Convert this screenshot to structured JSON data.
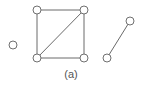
{
  "diagram": {
    "caption": "(a)",
    "node_radius": 4,
    "colors": {
      "edge": "#6a6a6a",
      "node_stroke": "#707070",
      "node_fill": "#ffffff",
      "caption": "#555555"
    },
    "nodes": [
      {
        "id": "isolated",
        "x": 13,
        "y": 45
      },
      {
        "id": "square-top-left",
        "x": 37,
        "y": 10
      },
      {
        "id": "square-top-right",
        "x": 84,
        "y": 10
      },
      {
        "id": "square-bottom-left",
        "x": 37,
        "y": 58
      },
      {
        "id": "square-bottom-right",
        "x": 84,
        "y": 58
      },
      {
        "id": "pair-top",
        "x": 130,
        "y": 21
      },
      {
        "id": "pair-bottom",
        "x": 107,
        "y": 58
      }
    ],
    "edges": [
      {
        "from": "square-top-left",
        "to": "square-top-right"
      },
      {
        "from": "square-top-left",
        "to": "square-bottom-left"
      },
      {
        "from": "square-top-right",
        "to": "square-bottom-right"
      },
      {
        "from": "square-bottom-left",
        "to": "square-bottom-right"
      },
      {
        "from": "square-bottom-left",
        "to": "square-top-right"
      },
      {
        "from": "pair-bottom",
        "to": "pair-top"
      }
    ]
  }
}
